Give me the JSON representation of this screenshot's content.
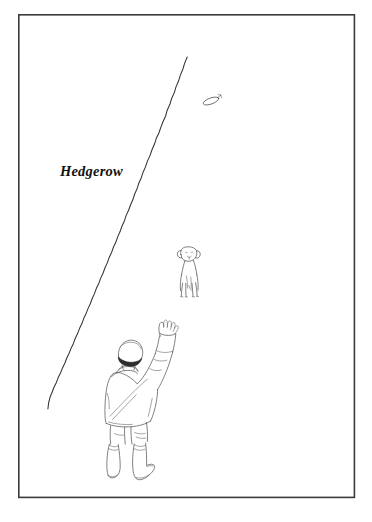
{
  "image": {
    "title": "Hedgerow field sketch",
    "width": 372,
    "height": 522,
    "background_color": "#ffffff",
    "ink_color": "#262626"
  },
  "frame": {
    "name": "illustration-border",
    "stroke_color": "#3b3b3b",
    "x": 18,
    "y": 14,
    "width": 337,
    "height": 484
  },
  "labels": {
    "hedgerow": {
      "text": "Hedgerow",
      "x": 60,
      "y": 163,
      "font_size": "14.5px",
      "font_style": "bold italic serif",
      "color": "#111111"
    }
  },
  "scene": {
    "hedgerow_line": {
      "name": "hedgerow-line",
      "description": "hand-drawn diagonal line representing a hedgerow receding into the distance",
      "start_point": [
        187,
        57
      ],
      "end_point": [
        48,
        409
      ],
      "stroke_color": "#333333"
    },
    "person": {
      "name": "person-figure",
      "description": "man seen from behind wearing a flat cap, jacket and wellington boots, right arm raised",
      "position": [
        100,
        327
      ],
      "width": 72,
      "height": 152,
      "wears": [
        "flat-cap",
        "jacket",
        "trousers",
        "wellington-boots"
      ],
      "pose": "right arm raised, throwing"
    },
    "dog": {
      "name": "dog-figure",
      "description": "dog facing the viewer, standing in the field beyond the man",
      "position": [
        172,
        248
      ],
      "width": 32,
      "height": 52
    },
    "flying_object": {
      "name": "thrown-object",
      "description": "small oval object in flight above the hedgerow",
      "position": [
        207,
        98
      ],
      "width": 18,
      "height": 10
    }
  }
}
